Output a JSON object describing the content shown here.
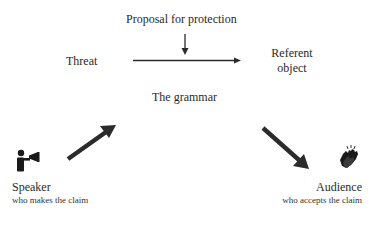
{
  "diagram": {
    "top_label": "Proposal for protection",
    "threat_label": "Threat",
    "referent_label_line1": "Referent",
    "referent_label_line2": "object",
    "grammar_label": "The grammar",
    "speaker": {
      "title": "Speaker",
      "subtitle": "who makes the claim",
      "icon": "megaphone-person-icon"
    },
    "audience": {
      "title": "Audience",
      "subtitle": "who accepts the claim",
      "icon": "clapping-hands-icon"
    },
    "colors": {
      "text": "#2a2a2a",
      "arrow": "#2b2b2b",
      "background": "#ffffff"
    }
  }
}
